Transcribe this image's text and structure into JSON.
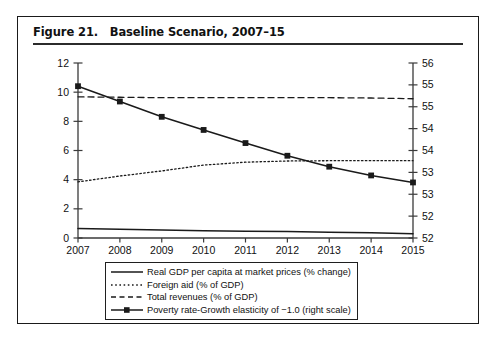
{
  "figure": {
    "title": "Figure 21.   Baseline Scenario, 2007–15"
  },
  "chart_data": {
    "type": "line",
    "title": "Figure 21.   Baseline Scenario, 2007–15",
    "xlabel": "",
    "ylabel": "",
    "grid": false,
    "legend_position": "bottom",
    "x": [
      2007,
      2008,
      2009,
      2010,
      2011,
      2012,
      2013,
      2014,
      2015
    ],
    "categories": [
      "2007",
      "2008",
      "2009",
      "2010",
      "2011",
      "2012",
      "2013",
      "2014",
      "2015"
    ],
    "left_axis": {
      "ylim": [
        0,
        12
      ],
      "ticks": [
        0,
        2,
        4,
        6,
        8,
        10,
        12
      ],
      "tick_labels": [
        "0",
        "2",
        "4",
        "6",
        "8",
        "10",
        "12"
      ]
    },
    "right_axis": {
      "ylim": [
        52,
        56
      ],
      "ticks": [
        52,
        52.5,
        53,
        53.5,
        54,
        54.5,
        55,
        55.5,
        56
      ],
      "tick_labels": [
        "52",
        "52",
        "53",
        "53",
        "54",
        "54",
        "55",
        "55",
        "56"
      ]
    },
    "series": [
      {
        "name": "Real GDP per capita at market prices (% change)",
        "axis": "left",
        "style": "solid",
        "marker": "none",
        "color": "#1a1a1a",
        "values": [
          0.65,
          0.6,
          0.55,
          0.5,
          0.47,
          0.44,
          0.4,
          0.36,
          0.3
        ]
      },
      {
        "name": "Foreign aid (% of GDP)",
        "axis": "left",
        "style": "dotted",
        "marker": "none",
        "color": "#1a1a1a",
        "values": [
          3.85,
          4.25,
          4.6,
          5.0,
          5.2,
          5.28,
          5.3,
          5.3,
          5.3
        ]
      },
      {
        "name": "Total revenues (% of GDP)",
        "axis": "left",
        "style": "dashed",
        "marker": "none",
        "color": "#1a1a1a",
        "values": [
          9.68,
          9.65,
          9.62,
          9.62,
          9.62,
          9.62,
          9.62,
          9.6,
          9.55
        ]
      },
      {
        "name": "Poverty rate-Growth elasticity of −1.0 (right scale)",
        "axis": "right",
        "style": "solid",
        "marker": "square",
        "color": "#1a1a1a",
        "values": [
          55.47,
          55.12,
          54.77,
          54.47,
          54.17,
          53.88,
          53.63,
          53.43,
          53.27
        ],
        "values_left_scale": [
          10.4,
          9.35,
          8.3,
          7.4,
          6.5,
          5.65,
          4.9,
          4.3,
          3.8
        ]
      }
    ]
  },
  "legend": {
    "items": [
      {
        "label": "Real GDP per capita at market prices (% change)",
        "key": "solid-line-key"
      },
      {
        "label": "Foreign aid (% of GDP)",
        "key": "dotted-line-key"
      },
      {
        "label": "Total revenues (% of GDP)",
        "key": "dashed-line-key"
      },
      {
        "label": "Poverty rate-Growth elasticity of −1.0 (right scale)",
        "key": "solid-square-marker-key"
      }
    ]
  }
}
